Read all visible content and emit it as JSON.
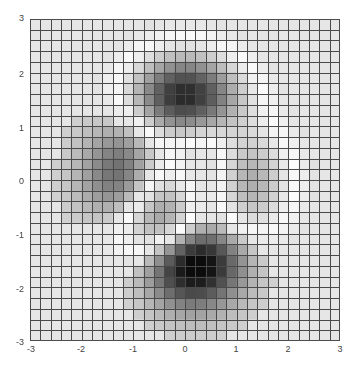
{
  "chart_data": {
    "type": "heatmap",
    "title": "",
    "xlabel": "",
    "ylabel": "",
    "function": "peaks",
    "xlim": [
      -3,
      3
    ],
    "ylim": [
      -3,
      3
    ],
    "step": 0.2,
    "grid": true,
    "colormap": "gray (dark = far from z≈1)",
    "x_ticks": [
      "-3",
      "-2",
      "-1",
      "0",
      "1",
      "2",
      "3"
    ],
    "y_ticks": [
      "3",
      "2",
      "1",
      "0",
      "-1",
      "-2",
      "-3"
    ],
    "features": [
      {
        "name": "top peak",
        "x": 0.0,
        "y": 1.6,
        "z": 8.1,
        "shade": "dark"
      },
      {
        "name": "left peak",
        "x": -1.3,
        "y": 0.2,
        "z": 3.8,
        "shade": "medium"
      },
      {
        "name": "bottom trough",
        "x": 0.2,
        "y": -1.6,
        "z": -6.5,
        "shade": "darkest"
      },
      {
        "name": "right small trough",
        "x": 1.3,
        "y": 0.0,
        "z": -0.5,
        "shade": "light"
      }
    ],
    "colors": {
      "background": "#e6e6e6",
      "gridline": "#4a4a4a",
      "brightest": "#fbfbfb",
      "darkest": "#0c0c0c"
    }
  }
}
